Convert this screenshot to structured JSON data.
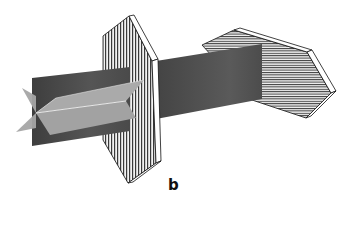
{
  "figure": {
    "panel_label": "b",
    "elements": [
      {
        "name": "incident-beam",
        "type": "beam",
        "color": "#4a4a4a"
      },
      {
        "name": "vibration-planes",
        "type": "crossed-planes",
        "color": "#a9a9a9"
      },
      {
        "name": "first-polarizer",
        "type": "plate",
        "hatch": "vertical"
      },
      {
        "name": "transmitted-beam",
        "type": "beam",
        "color": "#555555"
      },
      {
        "name": "second-polarizer",
        "type": "plate",
        "hatch": "horizontal"
      }
    ],
    "colors": {
      "beam_dark": "#4a4a4a",
      "plane_light": "#a8a8a8",
      "hatch": "#333333",
      "plate_bg": "#f4f4f4",
      "edge": "#111111"
    }
  }
}
